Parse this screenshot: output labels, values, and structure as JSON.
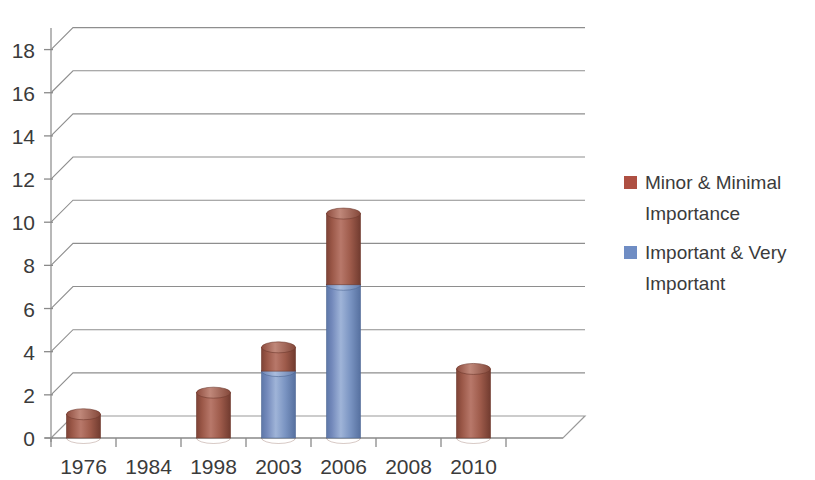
{
  "chart_data": {
    "type": "bar",
    "subtype": "stacked-column-3d",
    "title": "",
    "xlabel": "",
    "ylabel": "",
    "categories": [
      "1976",
      "1984",
      "1998",
      "2003",
      "2006",
      "2008",
      "2010"
    ],
    "series": [
      {
        "name": "Important & Very Important",
        "color": "#7A94C2",
        "values": [
          0,
          0,
          0,
          3.1,
          7.1,
          0,
          0
        ]
      },
      {
        "name": "Minor & Minimal Importance",
        "color": "#9E5B4B",
        "values": [
          1.1,
          0,
          2.1,
          1.1,
          3.3,
          0,
          3.2
        ]
      }
    ],
    "stack_order": [
      "Important & Very Important",
      "Minor & Minimal Importance"
    ],
    "totals": [
      1.1,
      0,
      2.1,
      4.2,
      10.4,
      0,
      3.2
    ],
    "ylim": [
      0,
      19
    ],
    "yticks": [
      0,
      2,
      4,
      6,
      8,
      10,
      12,
      14,
      16,
      18
    ],
    "ytick_labels": [
      "0",
      "2",
      "4",
      "6",
      "8",
      "10",
      "12",
      "14",
      "16",
      "18"
    ],
    "grid": true,
    "grid_axis": "y",
    "legend_position": "right"
  },
  "legend": {
    "entries": [
      {
        "label_line1": "Minor & Minimal",
        "label_line2": "Importance",
        "color": "#AE4F42"
      },
      {
        "label_line1": "Important & Very",
        "label_line2": "Important",
        "color": "#6F8DC4"
      }
    ]
  },
  "colors": {
    "brown_light": "#B8786A",
    "brown_mid": "#9E5B4B",
    "brown_dark": "#7E4336",
    "blue_light": "#9FB4D8",
    "blue_mid": "#7A94C2",
    "blue_dark": "#5D77A8",
    "gridline": "#8e8e8e",
    "axis": "#9a9a9a",
    "text": "#3b3b3b",
    "background": "#ffffff"
  }
}
